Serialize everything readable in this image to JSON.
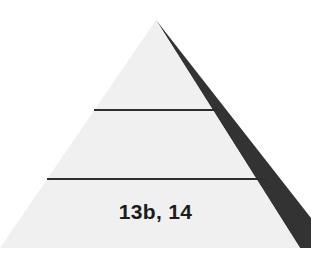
{
  "diagram": {
    "type": "pyramid",
    "tiers": [
      {
        "position": "top",
        "label": ""
      },
      {
        "position": "middle",
        "label": ""
      },
      {
        "position": "bottom",
        "label": "13b, 14"
      }
    ]
  },
  "colors": {
    "face": "#f0f0f0",
    "shadow": "#333333",
    "divider": "#2e2e2e",
    "text": "#1c1c1c"
  }
}
